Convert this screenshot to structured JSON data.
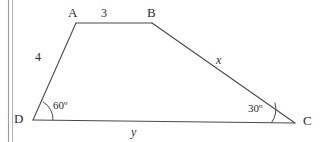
{
  "figure": {
    "kind": "geometry-diagram",
    "shape": "quadrilateral",
    "background_color": "#ffffff",
    "stroke_color": "#4a4a4a",
    "text_color": "#2b2b2b",
    "vertices": [
      {
        "name": "A",
        "label": "A",
        "x": 76,
        "y": 23
      },
      {
        "name": "B",
        "label": "B",
        "x": 152,
        "y": 23
      },
      {
        "name": "C",
        "label": "C",
        "x": 295,
        "y": 123
      },
      {
        "name": "D",
        "label": "D",
        "x": 33,
        "y": 120
      }
    ],
    "sides": [
      {
        "name": "AB",
        "label": "3",
        "from": "A",
        "to": "B",
        "kind": "known"
      },
      {
        "name": "BC",
        "label": "x",
        "from": "B",
        "to": "C",
        "kind": "unknown"
      },
      {
        "name": "CD",
        "label": "y",
        "from": "C",
        "to": "D",
        "kind": "unknown"
      },
      {
        "name": "DA",
        "label": "4",
        "from": "D",
        "to": "A",
        "kind": "known"
      }
    ],
    "angles": [
      {
        "name": "angle-D",
        "label": "60",
        "degree_symbol": "º",
        "vertex": "D",
        "value": 60
      },
      {
        "name": "angle-C",
        "label": "30",
        "degree_symbol": "º",
        "vertex": "C",
        "value": 30
      }
    ],
    "page_edge": {
      "name": "page-binding-edge",
      "line_x_outer": 8,
      "line_x_inner": 12,
      "color": "#8c8c96"
    }
  },
  "labels": {
    "vertex_a": "A",
    "vertex_b": "B",
    "vertex_c": "C",
    "vertex_d": "D",
    "side_ab": "3",
    "side_da": "4",
    "side_bc": "x",
    "side_dc": "y",
    "angle_d": "60º",
    "angle_c": "30º"
  }
}
